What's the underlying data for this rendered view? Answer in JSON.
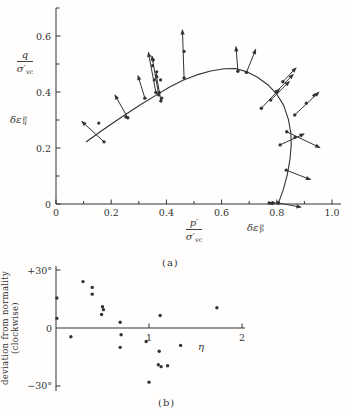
{
  "figure": {
    "bg": "#fffefd",
    "ink": "#333333",
    "caption_a": "(a)",
    "caption_b": "(b)"
  },
  "plot_a_labels": {
    "y_frac_num": "q",
    "y_frac_den": "σ′",
    "y_frac_den_sub": "vc",
    "y_strain_base": "δε",
    "y_strain_sup": "p",
    "y_strain_sub": "q",
    "x_frac_num": "p′",
    "x_frac_den": "σ′",
    "x_frac_den_sub": "vc",
    "x_strain_base": "δε",
    "x_strain_sup": "p",
    "x_strain_sub": "p"
  },
  "plot_b_labels": {
    "ylabel_line1": "deviation from normality",
    "ylabel_line2": "(clockwise)",
    "xlabel": "η"
  },
  "chart_data": [
    {
      "type": "line",
      "title": "Yield locus with plastic strain increment vectors",
      "xlabel": "p′/σ′vc   δε_p^p",
      "ylabel": "q/σ′vc   δε_q^p",
      "xlim": [
        0,
        1.03
      ],
      "ylim": [
        0,
        0.7
      ],
      "grid": false,
      "x_major_ticks": [
        {
          "v": 0.0,
          "label": "0"
        },
        {
          "v": 0.2,
          "label": "0.2"
        },
        {
          "v": 0.4,
          "label": "0.4"
        },
        {
          "v": 0.6,
          "label": "0.6"
        },
        {
          "v": 0.8,
          "label": "0.8"
        },
        {
          "v": 1.0,
          "label": "1.0"
        }
      ],
      "x_minor_ticks": [
        0.1,
        0.3,
        0.5,
        0.7,
        0.9
      ],
      "y_major_ticks": [
        {
          "v": 0.0,
          "label": "0"
        },
        {
          "v": 0.2,
          "label": "0.2"
        },
        {
          "v": 0.4,
          "label": "0.4"
        },
        {
          "v": 0.6,
          "label": "0.6"
        }
      ],
      "y_minor_ticks": [
        0.1,
        0.3,
        0.5,
        0.7
      ],
      "curve": [
        [
          0.11,
          0.222
        ],
        [
          0.16,
          0.258
        ],
        [
          0.21,
          0.292
        ],
        [
          0.26,
          0.325
        ],
        [
          0.31,
          0.357
        ],
        [
          0.36,
          0.387
        ],
        [
          0.41,
          0.417
        ],
        [
          0.46,
          0.442
        ],
        [
          0.51,
          0.461
        ],
        [
          0.56,
          0.475
        ],
        [
          0.61,
          0.483
        ],
        [
          0.65,
          0.484
        ],
        [
          0.69,
          0.473
        ],
        [
          0.73,
          0.453
        ],
        [
          0.77,
          0.424
        ],
        [
          0.8,
          0.392
        ],
        [
          0.825,
          0.352
        ],
        [
          0.842,
          0.302
        ],
        [
          0.851,
          0.252
        ],
        [
          0.852,
          0.21
        ],
        [
          0.848,
          0.16
        ],
        [
          0.838,
          0.105
        ],
        [
          0.824,
          0.052
        ],
        [
          0.806,
          0.004
        ]
      ],
      "vectors": [
        {
          "base": [
            0.174,
            0.222
          ],
          "tip": [
            0.091,
            0.297
          ]
        },
        {
          "base": [
            0.26,
            0.308
          ],
          "tip": [
            0.212,
            0.392
          ]
        },
        {
          "base": [
            0.322,
            0.378
          ],
          "tip": [
            0.296,
            0.462
          ]
        },
        {
          "base": [
            0.362,
            0.398
          ],
          "tip": [
            0.334,
            0.545
          ]
        },
        {
          "base": [
            0.372,
            0.39
          ],
          "tip": [
            0.347,
            0.532
          ]
        },
        {
          "base": [
            0.38,
            0.368
          ],
          "tip": [
            0.362,
            0.47
          ]
        },
        {
          "base": [
            0.464,
            0.45
          ],
          "tip": [
            0.458,
            0.625
          ],
          "dots": [
            [
              0.464,
              0.545
            ]
          ]
        },
        {
          "base": [
            0.659,
            0.474
          ],
          "tip": [
            0.652,
            0.565
          ]
        },
        {
          "base": [
            0.69,
            0.47
          ],
          "tip": [
            0.725,
            0.555
          ]
        },
        {
          "base": [
            0.744,
            0.342
          ],
          "tip": [
            0.812,
            0.413
          ]
        },
        {
          "base": [
            0.778,
            0.371
          ],
          "tip": [
            0.848,
            0.44
          ]
        },
        {
          "base": [
            0.798,
            0.401
          ],
          "tip": [
            0.862,
            0.465
          ]
        },
        {
          "base": [
            0.822,
            0.437
          ],
          "tip": [
            0.872,
            0.488
          ]
        },
        {
          "base": [
            0.865,
            0.318
          ],
          "tip": [
            0.955,
            0.402
          ],
          "dots": [
            [
              0.907,
              0.36
            ],
            [
              0.935,
              0.388
            ]
          ]
        },
        {
          "base": [
            0.812,
            0.211
          ],
          "tip": [
            0.902,
            0.252
          ],
          "dots": [
            [
              0.866,
              0.238
            ]
          ]
        },
        {
          "base": [
            0.836,
            0.258
          ],
          "tip": [
            0.959,
            0.2
          ]
        },
        {
          "base": [
            0.834,
            0.121
          ],
          "tip": [
            0.925,
            0.086
          ]
        },
        {
          "base": [
            0.805,
            0.004
          ],
          "tip": [
            0.891,
            -0.012
          ],
          "dots": [
            [
              0.772,
              0.004
            ],
            [
              0.787,
              0.004
            ]
          ]
        },
        {
          "base": [
            0.805,
            0.004
          ],
          "tip": [
            0.766,
            0.002
          ]
        }
      ],
      "extra_dots": [
        [
          0.155,
          0.289
        ],
        [
          0.253,
          0.311
        ],
        [
          0.352,
          0.514
        ],
        [
          0.35,
          0.494
        ],
        [
          0.365,
          0.472
        ],
        [
          0.356,
          0.443
        ],
        [
          0.379,
          0.443
        ],
        [
          0.374,
          0.398
        ],
        [
          0.383,
          0.378
        ]
      ]
    },
    {
      "type": "scatter",
      "title": "Deviation from normality versus stress ratio",
      "xlabel": "η",
      "ylabel": "deviation from normality (clockwise)",
      "xlim": [
        0,
        2.05
      ],
      "ylim": [
        -32,
        32
      ],
      "grid": false,
      "y_ticks": [
        {
          "v": 30,
          "label": "+30°"
        },
        {
          "v": 0,
          "label": "0"
        },
        {
          "v": -30,
          "label": "−30°"
        }
      ],
      "x_ticks": [
        {
          "v": 1,
          "label": "1"
        },
        {
          "v": 2,
          "label": "2"
        }
      ],
      "points": [
        [
          0.01,
          15.5
        ],
        [
          0.01,
          5.0
        ],
        [
          0.16,
          -4.5
        ],
        [
          0.29,
          24.0
        ],
        [
          0.39,
          21.0
        ],
        [
          0.39,
          17.5
        ],
        [
          0.5,
          11.0
        ],
        [
          0.51,
          9.5
        ],
        [
          0.49,
          7.0
        ],
        [
          0.69,
          3.0
        ],
        [
          0.7,
          -3.5
        ],
        [
          0.69,
          -10.0
        ],
        [
          0.97,
          -7.0
        ],
        [
          1.0,
          -28.0
        ],
        [
          1.1,
          -19.0
        ],
        [
          1.11,
          -12.0
        ],
        [
          1.13,
          -20.0
        ],
        [
          1.12,
          6.5
        ],
        [
          1.2,
          -19.5
        ],
        [
          1.34,
          -9.0
        ],
        [
          1.73,
          10.5
        ]
      ]
    }
  ]
}
